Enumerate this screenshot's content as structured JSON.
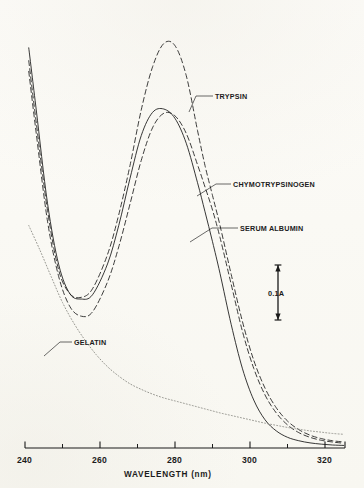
{
  "chart_data": {
    "type": "line",
    "title": "",
    "xlabel": "WAVELENGTH (nm)",
    "ylabel": "",
    "xlim": [
      240,
      326
    ],
    "ylim": [
      0,
      1.0
    ],
    "grid": false,
    "legend_position": "inline-annotations",
    "x_ticks_major": [
      240,
      260,
      280,
      300,
      320
    ],
    "x_ticks_minor": [
      250,
      270,
      290,
      310
    ],
    "scale_bar": {
      "label": "0.1A",
      "value": 0.1,
      "units": "A",
      "orientation": "vertical"
    },
    "series": [
      {
        "name": "TRYPSIN",
        "style": "dashed",
        "color": "#1a1a1a",
        "x": [
          241,
          243,
          246,
          249,
          252,
          255,
          258,
          262,
          265,
          268,
          271,
          274,
          277,
          280,
          283,
          286,
          288,
          290,
          292,
          295,
          298,
          301,
          304,
          307,
          310,
          313,
          316,
          319,
          322,
          325
        ],
        "y": [
          0.905,
          0.76,
          0.555,
          0.415,
          0.36,
          0.352,
          0.372,
          0.452,
          0.545,
          0.66,
          0.79,
          0.89,
          0.945,
          0.94,
          0.87,
          0.742,
          0.66,
          0.59,
          0.52,
          0.405,
          0.295,
          0.205,
          0.14,
          0.094,
          0.063,
          0.043,
          0.03,
          0.022,
          0.017,
          0.014
        ]
      },
      {
        "name": "CHYMOTRYPSINOGEN",
        "style": "dashed",
        "color": "#1a1a1a",
        "x": [
          241,
          243,
          246,
          249,
          252,
          255,
          258,
          262,
          265,
          268,
          271,
          274,
          277,
          280,
          283,
          286,
          288,
          290,
          292,
          295,
          298,
          301,
          304,
          307,
          310,
          313,
          316,
          319,
          322,
          325
        ],
        "y": [
          0.88,
          0.735,
          0.53,
          0.4,
          0.33,
          0.308,
          0.318,
          0.388,
          0.47,
          0.57,
          0.672,
          0.748,
          0.782,
          0.776,
          0.735,
          0.662,
          0.61,
          0.556,
          0.492,
          0.382,
          0.272,
          0.186,
          0.124,
          0.082,
          0.054,
          0.036,
          0.025,
          0.018,
          0.014,
          0.011
        ]
      },
      {
        "name": "SERUM ALBUMIN",
        "style": "solid",
        "color": "#141414",
        "x": [
          241,
          243,
          246,
          249,
          252,
          255,
          258,
          262,
          265,
          268,
          271,
          274,
          277,
          280,
          283,
          286,
          288,
          290,
          292,
          295,
          298,
          301,
          304,
          307,
          310,
          313,
          316,
          319,
          322,
          325
        ],
        "y": [
          0.935,
          0.79,
          0.572,
          0.428,
          0.36,
          0.348,
          0.358,
          0.43,
          0.52,
          0.63,
          0.73,
          0.784,
          0.792,
          0.77,
          0.712,
          0.62,
          0.552,
          0.482,
          0.408,
          0.288,
          0.185,
          0.112,
          0.066,
          0.04,
          0.025,
          0.017,
          0.012,
          0.009,
          0.007,
          0.006
        ]
      },
      {
        "name": "GELATIN",
        "style": "dotted",
        "color": "#8c8c86",
        "x": [
          241,
          244,
          247,
          250,
          253,
          256,
          259,
          262,
          265,
          268,
          271,
          274,
          277,
          280,
          283,
          286,
          289,
          292,
          295,
          298,
          301,
          304,
          307,
          310,
          313,
          316,
          319,
          322,
          325
        ],
        "y": [
          0.52,
          0.462,
          0.4,
          0.34,
          0.292,
          0.252,
          0.218,
          0.19,
          0.168,
          0.15,
          0.137,
          0.126,
          0.117,
          0.11,
          0.103,
          0.096,
          0.089,
          0.082,
          0.076,
          0.07,
          0.064,
          0.058,
          0.053,
          0.048,
          0.044,
          0.04,
          0.037,
          0.034,
          0.032
        ]
      }
    ]
  },
  "axis": {
    "title": "WAVELENGTH (nm)",
    "tick_labels": [
      "240",
      "260",
      "280",
      "300",
      "320"
    ]
  },
  "annotations": {
    "trypsin": "TRYPSIN",
    "chymotrypsinogen": "CHYMOTRYPSINOGEN",
    "serum_albumin": "SERUM ALBUMIN",
    "gelatin": "GELATIN",
    "scale_bar": "0.1A"
  },
  "colors": {
    "ink": "#1a1a1a",
    "faint_ink": "#8c8c86",
    "paper": "#fbfaf6"
  }
}
